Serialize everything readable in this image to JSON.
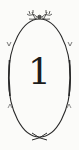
{
  "badge": {
    "numeral": "1",
    "ornament_top": "floral-crest",
    "ornament_bottom": "crossed-stems",
    "colors": {
      "background": "#fbfbf9",
      "ink": "#1c1c1c"
    }
  }
}
